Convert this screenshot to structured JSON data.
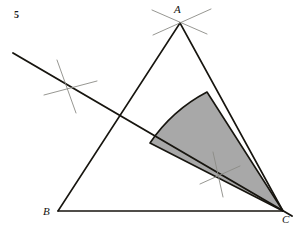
{
  "figure": {
    "number_label": "5",
    "type": "geometric-construction",
    "canvas": {
      "width": 302,
      "height": 227
    },
    "background_color": "#ffffff"
  },
  "colors": {
    "stroke_main": "#17150f",
    "stroke_construction": "#8b8b86",
    "sector_fill": "#a8a8a8",
    "sector_stroke": "#17150f",
    "label_text": "#15130f"
  },
  "vertices": [
    {
      "name": "A",
      "label": "A",
      "x": 180,
      "y": 23,
      "label_x": 174,
      "label_y": 13
    },
    {
      "name": "B",
      "label": "B",
      "x": 58,
      "y": 211,
      "label_x": 43,
      "label_y": 215
    },
    {
      "name": "C",
      "label": "C",
      "x": 283,
      "y": 211,
      "label_x": 282,
      "label_y": 223
    }
  ],
  "triangle": {
    "sides": [
      {
        "name": "side-AB",
        "from": "A",
        "to": "B",
        "x1": 180,
        "y1": 23,
        "x2": 58,
        "y2": 211
      },
      {
        "name": "side-AC",
        "from": "A",
        "to": "C",
        "x1": 180,
        "y1": 23,
        "x2": 283,
        "y2": 211
      },
      {
        "name": "side-BC",
        "from": "B",
        "to": "C",
        "x1": 58,
        "y1": 211,
        "x2": 283,
        "y2": 211
      }
    ],
    "stroke_width": 1.6
  },
  "bisector": {
    "name": "angle-bisector-from-C",
    "x1": 13,
    "y1": 53,
    "x2": 292,
    "y2": 216,
    "stroke_width": 1.9,
    "note": "Line through C bisecting angle C, extended beyond side AB to the upper left"
  },
  "sector": {
    "name": "shaded-sector-at-C",
    "center_x": 283,
    "center_y": 211,
    "arc_start_x": 150,
    "arc_start_y": 143,
    "arc_end_x": 207,
    "arc_end_y": 92,
    "radius": 156,
    "fill": "#a8a8a8",
    "stroke_width": 1.6,
    "edges": [
      {
        "name": "sector-edge-along-bisector",
        "note": "from C to arc start"
      },
      {
        "name": "sector-edge-along-AC",
        "note": "from C to arc end on side AC"
      }
    ]
  },
  "construction_arcs": [
    {
      "name": "arc-pair-at-apex-a-left",
      "path": "M 152 10 L 207 34",
      "stroke_width": 0.9
    },
    {
      "name": "arc-pair-at-apex-a-right",
      "path": "M 211 9 L 153 35",
      "stroke_width": 0.9
    },
    {
      "name": "arc-pair-on-bisector-outer-1",
      "path": "M 57 60 L 76 113",
      "stroke_width": 0.9
    },
    {
      "name": "arc-pair-on-bisector-outer-2",
      "path": "M 44 95 L 97 81",
      "stroke_width": 0.9
    },
    {
      "name": "arc-pair-on-bisector-inner-1",
      "path": "M 213 152 L 223 197",
      "stroke_width": 0.9
    },
    {
      "name": "arc-pair-on-bisector-inner-2",
      "path": "M 200 184 L 240 166",
      "stroke_width": 0.9
    }
  ]
}
